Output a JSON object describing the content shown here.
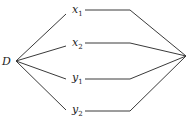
{
  "diagram": {
    "source_node": {
      "label": "D"
    },
    "branches": [
      {
        "var": "x",
        "sub": "1"
      },
      {
        "var": "x",
        "sub": "2"
      },
      {
        "var": "y",
        "sub": "1"
      },
      {
        "var": "y",
        "sub": "2"
      }
    ]
  }
}
